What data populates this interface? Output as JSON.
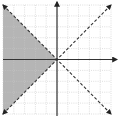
{
  "chart_data": {
    "type": "line",
    "title": "",
    "xlabel": "",
    "ylabel": "",
    "xlim": [
      -5,
      5
    ],
    "ylim": [
      -5,
      5
    ],
    "grid": true,
    "grid_style": "dotted",
    "axes_arrows": true,
    "series": [
      {
        "name": "y = -x",
        "style": "dashed",
        "arrows": "both",
        "points": [
          [
            -5,
            5
          ],
          [
            5,
            -5
          ]
        ]
      },
      {
        "name": "y = x",
        "style": "dashed",
        "arrows": "both",
        "points": [
          [
            -5,
            -5
          ],
          [
            5,
            5
          ]
        ]
      }
    ],
    "shaded_region": {
      "description": "x < -|y| (left wedge between y = x and y = -x)",
      "vertices": [
        [
          -5,
          5
        ],
        [
          0,
          0
        ],
        [
          -5,
          -5
        ]
      ],
      "color": "#b5b5b5"
    }
  },
  "colors": {
    "grid": "#c8c8c8",
    "axis": "#333333",
    "line": "#333333",
    "shade": "#b5b5b5"
  }
}
